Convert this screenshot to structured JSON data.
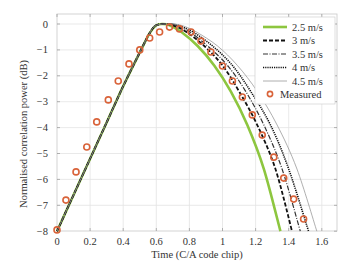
{
  "chart_data": {
    "type": "line",
    "title": "",
    "xlabel": "Time (C/A code chip)",
    "ylabel": "Normalised correlation power (dB)",
    "xlim": [
      0,
      1.7
    ],
    "ylim": [
      -8,
      0.3
    ],
    "xticks": [
      0,
      0.2,
      0.4,
      0.6,
      0.8,
      1,
      1.2,
      1.4,
      1.6
    ],
    "xtick_labels": [
      "0",
      "0.2",
      "0.4",
      "0.6",
      "0.8",
      "1",
      "1.2",
      "1.4",
      "1.6"
    ],
    "yticks": [
      0,
      -1,
      -2,
      -3,
      -4,
      -5,
      -6,
      -7,
      -8
    ],
    "ytick_labels": [
      "0",
      "−1",
      "−2",
      "−3",
      "−4",
      "−5",
      "−6",
      "−7",
      "−8"
    ],
    "grid": true,
    "legend_position": "upper right",
    "series": [
      {
        "name": "2.5 m/s",
        "style": "solid",
        "color": "#8dc63f",
        "width": 2.6,
        "points": [
          [
            0,
            -8
          ],
          [
            0.1,
            -6.6
          ],
          [
            0.2,
            -5.2
          ],
          [
            0.3,
            -3.8
          ],
          [
            0.4,
            -2.4
          ],
          [
            0.5,
            -1.1
          ],
          [
            0.56,
            -0.35
          ],
          [
            0.6,
            -0.05
          ],
          [
            0.64,
            0
          ],
          [
            0.68,
            -0.05
          ],
          [
            0.75,
            -0.3
          ],
          [
            0.85,
            -0.85
          ],
          [
            0.95,
            -1.6
          ],
          [
            1.05,
            -2.6
          ],
          [
            1.15,
            -3.9
          ],
          [
            1.25,
            -5.6
          ],
          [
            1.35,
            -8
          ]
        ]
      },
      {
        "name": "3 m/s",
        "style": "dashed",
        "color": "#111111",
        "width": 1.8,
        "points": [
          [
            0,
            -8
          ],
          [
            0.1,
            -6.6
          ],
          [
            0.2,
            -5.2
          ],
          [
            0.3,
            -3.8
          ],
          [
            0.4,
            -2.4
          ],
          [
            0.5,
            -1.1
          ],
          [
            0.56,
            -0.35
          ],
          [
            0.6,
            -0.05
          ],
          [
            0.65,
            0
          ],
          [
            0.7,
            -0.05
          ],
          [
            0.78,
            -0.3
          ],
          [
            0.89,
            -0.85
          ],
          [
            1.0,
            -1.6
          ],
          [
            1.1,
            -2.6
          ],
          [
            1.21,
            -3.9
          ],
          [
            1.32,
            -5.6
          ],
          [
            1.42,
            -8
          ]
        ]
      },
      {
        "name": "3.5 m/s",
        "style": "dashdot",
        "color": "#333333",
        "width": 1.2,
        "points": [
          [
            0,
            -8
          ],
          [
            0.1,
            -6.6
          ],
          [
            0.2,
            -5.2
          ],
          [
            0.3,
            -3.8
          ],
          [
            0.4,
            -2.4
          ],
          [
            0.5,
            -1.1
          ],
          [
            0.56,
            -0.35
          ],
          [
            0.6,
            -0.05
          ],
          [
            0.66,
            0
          ],
          [
            0.72,
            -0.05
          ],
          [
            0.8,
            -0.3
          ],
          [
            0.91,
            -0.85
          ],
          [
            1.03,
            -1.6
          ],
          [
            1.14,
            -2.6
          ],
          [
            1.25,
            -3.9
          ],
          [
            1.36,
            -5.6
          ],
          [
            1.47,
            -8
          ]
        ]
      },
      {
        "name": "4 m/s",
        "style": "dotted",
        "color": "#111111",
        "width": 1.6,
        "points": [
          [
            0,
            -8
          ],
          [
            0.1,
            -6.6
          ],
          [
            0.2,
            -5.2
          ],
          [
            0.3,
            -3.8
          ],
          [
            0.4,
            -2.4
          ],
          [
            0.5,
            -1.1
          ],
          [
            0.56,
            -0.35
          ],
          [
            0.6,
            -0.05
          ],
          [
            0.67,
            0
          ],
          [
            0.73,
            -0.05
          ],
          [
            0.82,
            -0.3
          ],
          [
            0.94,
            -0.85
          ],
          [
            1.06,
            -1.6
          ],
          [
            1.17,
            -2.6
          ],
          [
            1.29,
            -3.9
          ],
          [
            1.4,
            -5.6
          ],
          [
            1.52,
            -8
          ]
        ]
      },
      {
        "name": "4.5 m/s",
        "style": "thin",
        "color": "#9a9a9a",
        "width": 0.8,
        "points": [
          [
            0,
            -8
          ],
          [
            0.1,
            -6.6
          ],
          [
            0.2,
            -5.2
          ],
          [
            0.3,
            -3.8
          ],
          [
            0.4,
            -2.4
          ],
          [
            0.5,
            -1.1
          ],
          [
            0.56,
            -0.35
          ],
          [
            0.6,
            -0.05
          ],
          [
            0.68,
            0
          ],
          [
            0.75,
            -0.05
          ],
          [
            0.84,
            -0.3
          ],
          [
            0.97,
            -0.85
          ],
          [
            1.09,
            -1.6
          ],
          [
            1.21,
            -2.6
          ],
          [
            1.33,
            -3.9
          ],
          [
            1.45,
            -5.6
          ],
          [
            1.57,
            -8
          ]
        ]
      }
    ],
    "measured": {
      "name": "Measured",
      "marker": "circle",
      "color": "#d9633a",
      "x": [
        0,
        0.054,
        0.115,
        0.18,
        0.24,
        0.31,
        0.37,
        0.435,
        0.5,
        0.56,
        0.62,
        0.68,
        0.74,
        0.81,
        0.87,
        0.93,
        1.0,
        1.06,
        1.12,
        1.18,
        1.24,
        1.31,
        1.37,
        1.43,
        1.49
      ],
      "y": [
        -7.95,
        -6.8,
        -5.71,
        -4.75,
        -3.78,
        -2.93,
        -2.2,
        -1.54,
        -1.0,
        -0.54,
        -0.31,
        -0.12,
        -0.19,
        -0.31,
        -0.66,
        -1.08,
        -1.62,
        -2.2,
        -2.82,
        -3.51,
        -4.29,
        -5.14,
        -5.95,
        -6.76,
        -7.53
      ]
    }
  }
}
